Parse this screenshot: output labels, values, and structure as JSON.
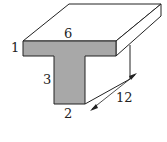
{
  "diagram": {
    "type": "3D T-beam",
    "labels": {
      "top_width": "6",
      "flange_thickness": "1",
      "stem_height": "3",
      "stem_width": "2",
      "length": "12"
    },
    "colors": {
      "face": "#a8a8a8",
      "stroke": "#222222",
      "background": "#ffffff"
    }
  }
}
